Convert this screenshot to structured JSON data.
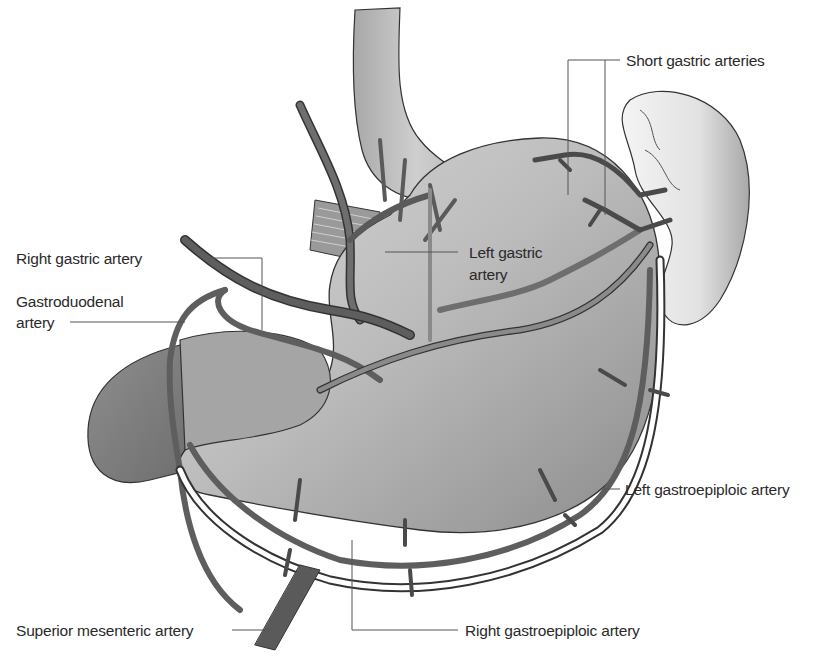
{
  "figure": {
    "organs": [
      "esophagus",
      "stomach",
      "spleen",
      "duodenum",
      "diaphragm"
    ]
  },
  "labels": {
    "short_gastric": "Short gastric arteries",
    "right_gastric": "Right gastric artery",
    "left_gastric_line1": "Left gastric",
    "left_gastric_line2": "artery",
    "gastroduodenal_line1": "Gastroduodenal",
    "gastroduodenal_line2": "artery",
    "left_gastroepiploic": "Left gastroepiploic artery",
    "superior_mesenteric": "Superior mesenteric artery",
    "right_gastroepiploic": "Right gastroepiploic artery"
  },
  "colors": {
    "organ_fill": "#b8b8b8",
    "organ_light": "#e6e6e6",
    "artery_dark": "#4a4a4a",
    "artery_mid": "#7a7a7a",
    "outline": "#333333",
    "text": "#2a2a2a"
  }
}
